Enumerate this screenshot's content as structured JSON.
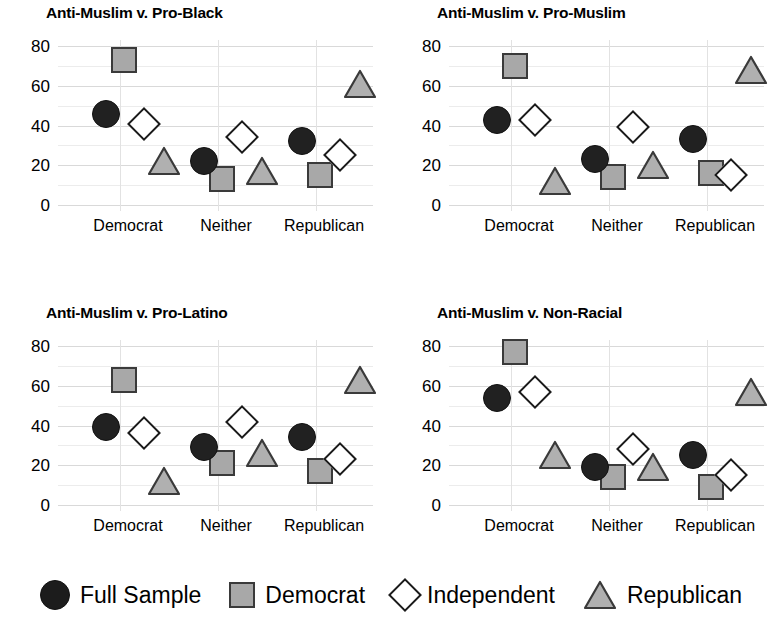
{
  "chart_data": {
    "type": "scatter",
    "title": "",
    "panel_layout": "2x2 small multiples",
    "xlabel": "",
    "ylabel": "",
    "ylim": [
      0,
      80
    ],
    "yticks": [
      0,
      20,
      40,
      60,
      80
    ],
    "y_minor_step": 10,
    "grid": true,
    "legend_position": "bottom",
    "categories": [
      "Democrat",
      "Neither",
      "Republican"
    ],
    "legend": [
      {
        "name": "Full Sample",
        "marker": "circle",
        "fill": "#1c1c1c",
        "stroke": "#111111"
      },
      {
        "name": "Democrat",
        "marker": "square",
        "fill": "#a8a8a8",
        "stroke": "#3a3a3a"
      },
      {
        "name": "Independent",
        "marker": "diamond",
        "fill": "#ffffff",
        "stroke": "#1a1a1a"
      },
      {
        "name": "Republican",
        "marker": "triangle",
        "fill": "#b0b0b0",
        "stroke": "#3a3a3a"
      }
    ],
    "panels": [
      {
        "title": "Anti-Muslim v. Pro-Black",
        "series": [
          {
            "name": "Full Sample",
            "values": [
              46,
              22,
              32
            ]
          },
          {
            "name": "Democrat",
            "values": [
              73,
              13,
              15
            ]
          },
          {
            "name": "Independent",
            "values": [
              41,
              34,
              25
            ]
          },
          {
            "name": "Republican",
            "values": [
              22,
              17,
              61
            ]
          }
        ]
      },
      {
        "title": "Anti-Muslim v. Pro-Muslim",
        "series": [
          {
            "name": "Full Sample",
            "values": [
              43,
              23,
              33
            ]
          },
          {
            "name": "Democrat",
            "values": [
              70,
              14,
              16
            ]
          },
          {
            "name": "Independent",
            "values": [
              43,
              39,
              15
            ]
          },
          {
            "name": "Republican",
            "values": [
              12,
              20,
              68
            ]
          }
        ]
      },
      {
        "title": "Anti-Muslim v. Pro-Latino",
        "series": [
          {
            "name": "Full Sample",
            "values": [
              39,
              29,
              34
            ]
          },
          {
            "name": "Democrat",
            "values": [
              63,
              21,
              17
            ]
          },
          {
            "name": "Independent",
            "values": [
              36,
              42,
              23
            ]
          },
          {
            "name": "Republican",
            "values": [
              12,
              26,
              63
            ]
          }
        ]
      },
      {
        "title": "Anti-Muslim v. Non-Racial",
        "series": [
          {
            "name": "Full Sample",
            "values": [
              54,
              19,
              25
            ]
          },
          {
            "name": "Democrat",
            "values": [
              77,
              14,
              9
            ]
          },
          {
            "name": "Independent",
            "values": [
              57,
              28,
              15
            ]
          },
          {
            "name": "Republican",
            "values": [
              25,
              19,
              57
            ]
          }
        ]
      }
    ]
  }
}
